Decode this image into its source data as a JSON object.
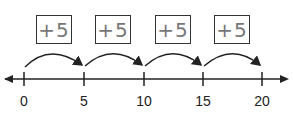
{
  "diagram": {
    "type": "number-line-skip-counting",
    "axis": {
      "min": 0,
      "max": 20,
      "ticks": [
        0,
        5,
        10,
        15,
        20
      ],
      "arrows": "both"
    },
    "jumps": [
      {
        "from": 0,
        "to": 5,
        "label": "+5"
      },
      {
        "from": 5,
        "to": 10,
        "label": "+5"
      },
      {
        "from": 10,
        "to": 15,
        "label": "+5"
      },
      {
        "from": 15,
        "to": 20,
        "label": "+5"
      }
    ],
    "tick_labels": [
      "0",
      "5",
      "10",
      "15",
      "20"
    ]
  }
}
